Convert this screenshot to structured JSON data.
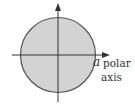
{
  "diagram": {
    "type": "polar-region",
    "labels": {
      "radius": "a",
      "polar_axis_line1": "polar",
      "polar_axis_line2": "axis"
    },
    "colors": {
      "fill": "#d3d3d3",
      "stroke": "#555555",
      "axis": "#333333",
      "background": "#ffffff"
    }
  }
}
